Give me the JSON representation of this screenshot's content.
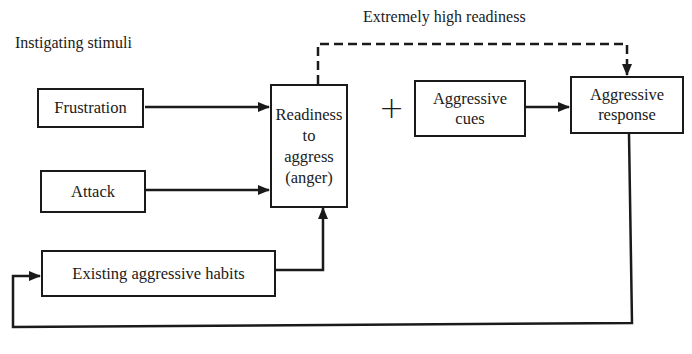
{
  "diagram": {
    "labels": {
      "instigating_stimuli": "Instigating stimuli",
      "extremely_high_readiness": "Extremely high readiness",
      "plus": "+"
    },
    "nodes": {
      "frustration": "Frustration",
      "attack": "Attack",
      "existing_habits": "Existing aggressive habits",
      "readiness": {
        "line1": "Readiness",
        "line2": "to",
        "line3": "aggress",
        "line4": "(anger)"
      },
      "aggressive_cues": {
        "line1": "Aggressive",
        "line2": "cues"
      },
      "aggressive_response": {
        "line1": "Aggressive",
        "line2": "response"
      }
    },
    "edges": [
      {
        "from": "Frustration",
        "to": "Readiness to aggress (anger)",
        "style": "solid"
      },
      {
        "from": "Attack",
        "to": "Readiness to aggress (anger)",
        "style": "solid"
      },
      {
        "from": "Existing aggressive habits",
        "to": "Readiness to aggress (anger)",
        "style": "solid"
      },
      {
        "from": "Aggressive cues",
        "to": "Aggressive response",
        "style": "solid"
      },
      {
        "from": "Readiness to aggress (anger)",
        "to": "Aggressive response",
        "style": "dashed",
        "label": "Extremely high readiness"
      },
      {
        "from": "Aggressive response",
        "to": "Existing aggressive habits",
        "style": "solid",
        "label": "feedback"
      }
    ],
    "colors": {
      "ink": "#1a1a1a",
      "background": "#ffffff"
    }
  }
}
